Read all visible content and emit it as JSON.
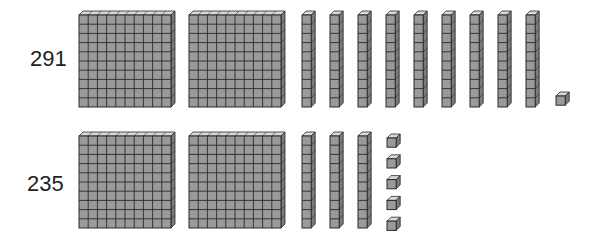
{
  "colors": {
    "block_face": "#9a9a9a",
    "block_top": "#d8d8d8",
    "block_side": "#7a7a7a",
    "grid_line": "#2a2a2a",
    "label_text": "#222222"
  },
  "rows": [
    {
      "label": "291",
      "hundreds": 2,
      "tens": 9,
      "ones": 1
    },
    {
      "label": "235",
      "hundreds": 2,
      "tens": 3,
      "ones": 5
    }
  ]
}
